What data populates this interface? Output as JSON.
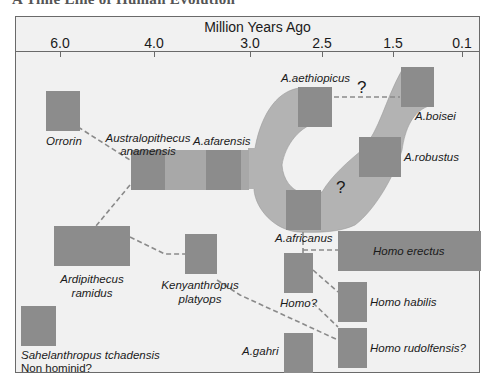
{
  "header": {
    "cut_title": "A Time Line of Human Evolution"
  },
  "axis": {
    "title": "Million Years Ago",
    "ticks": [
      {
        "label": "6.0",
        "x": 60
      },
      {
        "label": "4.0",
        "x": 154
      },
      {
        "label": "3.0",
        "x": 250
      },
      {
        "label": "2.5",
        "x": 322
      },
      {
        "label": "1.5",
        "x": 393
      },
      {
        "label": "0.1",
        "x": 462
      }
    ]
  },
  "colors": {
    "frame_bg": "#f1f1f1",
    "box": "#8c8c8c",
    "box_light": "#a8a8a8",
    "band": "#b3b3b3",
    "dash": "#8a8a8a"
  },
  "species": {
    "orrorin": "Orrorin",
    "anamensis_1": "Australopithecus",
    "anamensis_2": "anamensis",
    "afarensis": "A.afarensis",
    "aethiopicus": "A.aethiopicus",
    "boisei": "A.boisei",
    "robustus": "A.robustus",
    "africanus": "A.africanus",
    "ardipithecus_1": "Ardipithecus",
    "ardipithecus_2": "ramidus",
    "kenyanthropus_1": "Kenyanthropus",
    "kenyanthropus_2": "platyops",
    "homo_q": "Homo?",
    "homo_erectus": "Homo erectus",
    "homo_habilis": "Homo habilis",
    "homo_rudolfensis": "Homo rudolfensis?",
    "gahri": "A.gahri",
    "sahelanthropus": "Sahelanthropus tchadensis",
    "non_hominid": "Non hominid?"
  },
  "annotations": {
    "question_1": "?",
    "question_2": "?"
  }
}
